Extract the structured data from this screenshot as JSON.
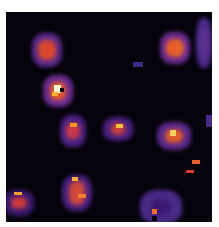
{
  "image": {
    "description": "False-color (inferno-like) microscopy heatmap showing bright spots on a dark background",
    "background": "#04020a",
    "colormap": [
      "#04020a",
      "#2a0b4a",
      "#5a2a8a",
      "#8a3fa0",
      "#c0306a",
      "#e85a2a",
      "#f89a20",
      "#fff7d0"
    ]
  },
  "blobs": [
    {
      "x": 32,
      "y": 33,
      "w": 30,
      "h": 34,
      "halo": "#5a2a8a",
      "core": "#d8482e",
      "coreW": 18,
      "coreH": 20
    },
    {
      "x": 43,
      "y": 75,
      "w": 30,
      "h": 32,
      "halo": "#6a2e90",
      "core": "#e85a2a",
      "coreW": 16,
      "coreH": 18
    },
    {
      "x": 160,
      "y": 32,
      "w": 30,
      "h": 32,
      "halo": "#6a2e90",
      "core": "#e8602a",
      "coreW": 18,
      "coreH": 18
    },
    {
      "x": 60,
      "y": 115,
      "w": 26,
      "h": 32,
      "halo": "#4a2280",
      "core": "#c83a4a",
      "coreW": 14,
      "coreH": 16
    },
    {
      "x": 103,
      "y": 117,
      "w": 30,
      "h": 24,
      "halo": "#4a2280",
      "core": "#c8403a",
      "coreW": 14,
      "coreH": 12
    },
    {
      "x": 157,
      "y": 122,
      "w": 34,
      "h": 28,
      "halo": "#5a2a8a",
      "core": "#e05a2a",
      "coreW": 18,
      "coreH": 14
    },
    {
      "x": 62,
      "y": 175,
      "w": 30,
      "h": 36,
      "halo": "#4a2280",
      "core": "#d04a3a",
      "coreW": 16,
      "coreH": 24
    },
    {
      "x": 4,
      "y": 190,
      "w": 30,
      "h": 26,
      "halo": "#3a1a70",
      "core": "#c83a3a",
      "coreW": 16,
      "coreH": 12
    },
    {
      "x": 140,
      "y": 190,
      "w": 42,
      "h": 34,
      "halo": "#4a2a88",
      "core": "#3a1a70",
      "coreW": 20,
      "coreH": 16
    },
    {
      "x": 196,
      "y": 18,
      "w": 16,
      "h": 50,
      "halo": "#4a2a88",
      "core": "#5a3090",
      "coreW": 10,
      "coreH": 30
    }
  ],
  "hotspots": [
    {
      "x": 54,
      "y": 85,
      "w": 7,
      "h": 8,
      "color": "#fff7d0"
    },
    {
      "x": 60,
      "y": 88,
      "w": 4,
      "h": 4,
      "color": "#04020a"
    },
    {
      "x": 52,
      "y": 92,
      "w": 6,
      "h": 4,
      "color": "#f8b030"
    },
    {
      "x": 70,
      "y": 123,
      "w": 7,
      "h": 4,
      "color": "#f89a20"
    },
    {
      "x": 116,
      "y": 124,
      "w": 7,
      "h": 4,
      "color": "#f8c040"
    },
    {
      "x": 170,
      "y": 130,
      "w": 6,
      "h": 6,
      "color": "#f8d060"
    },
    {
      "x": 72,
      "y": 177,
      "w": 6,
      "h": 4,
      "color": "#f8b030"
    },
    {
      "x": 78,
      "y": 194,
      "w": 8,
      "h": 4,
      "color": "#f08030"
    },
    {
      "x": 14,
      "y": 192,
      "w": 8,
      "h": 3,
      "color": "#f8a030"
    },
    {
      "x": 152,
      "y": 209,
      "w": 5,
      "h": 5,
      "color": "#f07030"
    },
    {
      "x": 152,
      "y": 216,
      "w": 5,
      "h": 5,
      "color": "#04020a"
    },
    {
      "x": 192,
      "y": 160,
      "w": 8,
      "h": 4,
      "color": "#e8602a"
    },
    {
      "x": 186,
      "y": 170,
      "w": 8,
      "h": 3,
      "color": "#d8402a"
    },
    {
      "x": 133,
      "y": 62,
      "w": 10,
      "h": 5,
      "color": "#3a2a80"
    },
    {
      "x": 206,
      "y": 115,
      "w": 6,
      "h": 12,
      "color": "#4a2a88"
    }
  ]
}
